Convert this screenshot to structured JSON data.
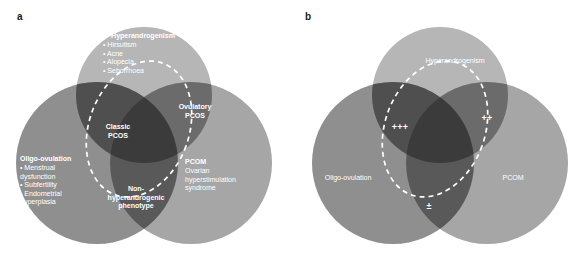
{
  "figure": {
    "type": "venn-diagram",
    "background": "#ffffff",
    "colors": {
      "hyperandrogenism": "#b6b6b6",
      "oligo_ovulation": "#8c8c8c",
      "pcom": "#a3a3a3",
      "overlap_dark": "#4a4a4a",
      "overlap_darkest": "#3a3a3a",
      "text": "#ffffff",
      "dashed_outline": "#ffffff",
      "panel_letter": "#1a1a1a"
    }
  },
  "panel_a": {
    "letter": "a",
    "sets": {
      "hyperandrogenism": {
        "title": "Hyperandrogenism",
        "items": "• Hirsutism\n• Acne\n• Alopecia\n• Seborrhoea"
      },
      "oligo_ovulation": {
        "title": "Oligo-ovulation",
        "items": "• Menstrual\n  dysfunction\n• Subfertility\n• Endometrial\n  hyperplasia"
      },
      "pcom": {
        "title": "PCOM",
        "items": "Ovarian\nhyperstimulation\nsyndrome"
      }
    },
    "regions": {
      "classic_pcos": "Classic\nPCOS",
      "ovulatory_pcos": "Ovulatory\nPCOS",
      "non_hyperandrogenic": "Non-\nhyperandrogenic\nphenotype"
    }
  },
  "panel_b": {
    "letter": "b",
    "sets": {
      "hyperandrogenism": "Hyperandrogenism",
      "oligo_ovulation": "Oligo-ovulation",
      "pcom": "PCOM"
    },
    "severity_marks": {
      "classic_pcos": "+++",
      "ovulatory_pcos": "++",
      "non_hyperandrogenic": "±"
    }
  }
}
